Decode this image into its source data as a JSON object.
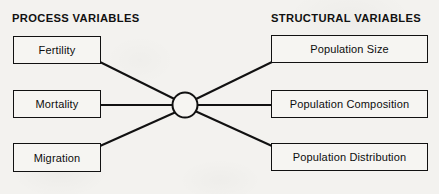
{
  "diagram": {
    "title_left": "PROCESS VARIABLES",
    "title_right": "STRUCTURAL VARIABLES",
    "colors": {
      "background": "#f3f2ef",
      "stroke": "#111111",
      "box_fill": "#f6f5f2",
      "text": "#0d0d0d"
    },
    "left_nodes": [
      {
        "id": "fertility",
        "label": "Fertility"
      },
      {
        "id": "mortality",
        "label": "Mortality"
      },
      {
        "id": "migration",
        "label": "Migration"
      }
    ],
    "hub": {
      "id": "central-junction",
      "label": "",
      "shape": "circle"
    },
    "right_nodes": [
      {
        "id": "population-size",
        "label": "Population Size"
      },
      {
        "id": "population-composition",
        "label": "Population Composition"
      },
      {
        "id": "population-distribution",
        "label": "Population Distribution"
      }
    ],
    "connections": [
      {
        "from": "fertility",
        "to": "central-junction"
      },
      {
        "from": "mortality",
        "to": "central-junction"
      },
      {
        "from": "migration",
        "to": "central-junction"
      },
      {
        "from": "central-junction",
        "to": "population-size"
      },
      {
        "from": "central-junction",
        "to": "population-composition"
      },
      {
        "from": "central-junction",
        "to": "population-distribution"
      }
    ]
  }
}
